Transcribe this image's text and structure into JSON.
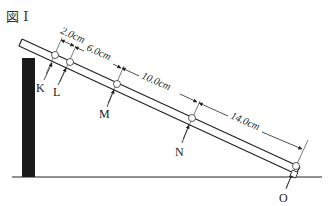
{
  "figure": {
    "title": "図 I"
  },
  "points": [
    {
      "id": "K",
      "label": "K"
    },
    {
      "id": "L",
      "label": "L"
    },
    {
      "id": "M",
      "label": "M"
    },
    {
      "id": "N",
      "label": "N"
    },
    {
      "id": "O",
      "label": "O"
    }
  ],
  "dimensions": [
    {
      "from": "K",
      "to": "L",
      "label": "2.0cm"
    },
    {
      "from": "L",
      "to": "M",
      "label": "6.0cm"
    },
    {
      "from": "M",
      "to": "N",
      "label": "10.0cm"
    },
    {
      "from": "N",
      "to": "O",
      "label": "14.0cm"
    }
  ],
  "colors": {
    "ink": "#222222",
    "post": "#1a1a1a",
    "background": "#ffffff"
  }
}
